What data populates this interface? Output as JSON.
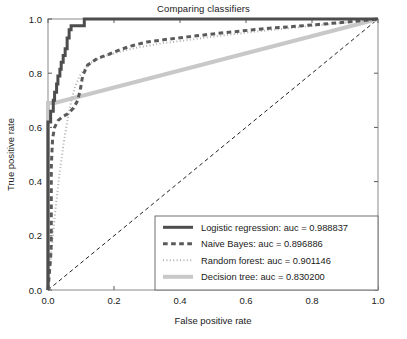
{
  "chart_data": {
    "type": "line",
    "title": "Comparing classifiers",
    "xlabel": "False positive rate",
    "ylabel": "True positive rate",
    "xlim": [
      0.0,
      1.0
    ],
    "ylim": [
      0.0,
      1.0
    ],
    "xticks": [
      "0.0",
      "0.2",
      "0.4",
      "0.6",
      "0.8",
      "1.0"
    ],
    "yticks": [
      "0.0",
      "0.2",
      "0.4",
      "0.6",
      "0.8",
      "1.0"
    ],
    "xtick_values": [
      0.0,
      0.2,
      0.4,
      0.6,
      0.8,
      1.0
    ],
    "ytick_values": [
      0.0,
      0.2,
      0.4,
      0.6,
      0.8,
      1.0
    ],
    "grid": false,
    "legend_position": "lower right",
    "series": [
      {
        "name": "Logistic regression",
        "label": "Logistic regression: auc = 0.988837",
        "auc": 0.988837,
        "color": "#4d4d4d",
        "linestyle": "solid",
        "linewidth": 3,
        "points": [
          [
            0.0,
            0.0
          ],
          [
            0.0,
            0.62
          ],
          [
            0.008,
            0.62
          ],
          [
            0.008,
            0.66
          ],
          [
            0.016,
            0.66
          ],
          [
            0.016,
            0.7
          ],
          [
            0.02,
            0.7
          ],
          [
            0.02,
            0.73
          ],
          [
            0.026,
            0.73
          ],
          [
            0.026,
            0.76
          ],
          [
            0.03,
            0.76
          ],
          [
            0.03,
            0.79
          ],
          [
            0.036,
            0.79
          ],
          [
            0.036,
            0.815
          ],
          [
            0.04,
            0.815
          ],
          [
            0.04,
            0.84
          ],
          [
            0.046,
            0.84
          ],
          [
            0.046,
            0.865
          ],
          [
            0.052,
            0.865
          ],
          [
            0.052,
            0.89
          ],
          [
            0.058,
            0.89
          ],
          [
            0.058,
            0.93
          ],
          [
            0.064,
            0.93
          ],
          [
            0.064,
            0.96
          ],
          [
            0.07,
            0.96
          ],
          [
            0.07,
            0.975
          ],
          [
            0.11,
            0.975
          ],
          [
            0.11,
            1.0
          ],
          [
            1.0,
            1.0
          ]
        ]
      },
      {
        "name": "Naive Bayes",
        "label": "Naive Bayes: auc = 0.896886",
        "auc": 0.896886,
        "color": "#5a5a5a",
        "linestyle": "dashed",
        "linewidth": 3,
        "points": [
          [
            0.0,
            0.0
          ],
          [
            0.008,
            0.12
          ],
          [
            0.01,
            0.175
          ],
          [
            0.01,
            0.23
          ],
          [
            0.01,
            0.29
          ],
          [
            0.01,
            0.345
          ],
          [
            0.01,
            0.4
          ],
          [
            0.01,
            0.455
          ],
          [
            0.012,
            0.51
          ],
          [
            0.014,
            0.56
          ],
          [
            0.02,
            0.6
          ],
          [
            0.03,
            0.625
          ],
          [
            0.045,
            0.64
          ],
          [
            0.06,
            0.65
          ],
          [
            0.078,
            0.672
          ],
          [
            0.09,
            0.7
          ],
          [
            0.098,
            0.74
          ],
          [
            0.105,
            0.79
          ],
          [
            0.12,
            0.83
          ],
          [
            0.15,
            0.855
          ],
          [
            0.185,
            0.87
          ],
          [
            0.215,
            0.885
          ],
          [
            0.25,
            0.9
          ],
          [
            0.3,
            0.915
          ],
          [
            0.36,
            0.925
          ],
          [
            0.43,
            0.935
          ],
          [
            0.5,
            0.945
          ],
          [
            0.58,
            0.955
          ],
          [
            0.66,
            0.965
          ],
          [
            0.74,
            0.972
          ],
          [
            0.82,
            0.98
          ],
          [
            0.9,
            0.988
          ],
          [
            1.0,
            1.0
          ]
        ]
      },
      {
        "name": "Random forest",
        "label": "Random forest: auc = 0.901146",
        "auc": 0.901146,
        "color": "#b5b5b5",
        "linestyle": "dotted",
        "linewidth": 2,
        "points": [
          [
            0.0,
            0.0
          ],
          [
            0.01,
            0.14
          ],
          [
            0.022,
            0.29
          ],
          [
            0.034,
            0.42
          ],
          [
            0.046,
            0.53
          ],
          [
            0.058,
            0.62
          ],
          [
            0.07,
            0.695
          ],
          [
            0.082,
            0.75
          ],
          [
            0.096,
            0.79
          ],
          [
            0.112,
            0.818
          ],
          [
            0.13,
            0.838
          ],
          [
            0.155,
            0.855
          ],
          [
            0.185,
            0.868
          ],
          [
            0.22,
            0.88
          ],
          [
            0.26,
            0.892
          ],
          [
            0.305,
            0.902
          ],
          [
            0.355,
            0.912
          ],
          [
            0.41,
            0.92
          ],
          [
            0.47,
            0.93
          ],
          [
            0.535,
            0.94
          ],
          [
            0.605,
            0.95
          ],
          [
            0.68,
            0.96
          ],
          [
            0.76,
            0.97
          ],
          [
            0.845,
            0.98
          ],
          [
            0.925,
            0.99
          ],
          [
            1.0,
            1.0
          ]
        ]
      },
      {
        "name": "Decision tree",
        "label": "Decision tree: auc = 0.830200",
        "auc": 0.8302,
        "color": "#c8c8c8",
        "linestyle": "solid",
        "linewidth": 4,
        "points": [
          [
            0.0,
            0.0
          ],
          [
            0.0,
            0.69
          ],
          [
            0.02,
            0.69
          ],
          [
            1.0,
            1.0
          ]
        ]
      }
    ],
    "reference_line": {
      "name": "chance-diagonal",
      "color": "#222222",
      "linestyle": "dashed",
      "linewidth": 1,
      "points": [
        [
          0.0,
          0.0
        ],
        [
          1.0,
          1.0
        ]
      ]
    }
  }
}
